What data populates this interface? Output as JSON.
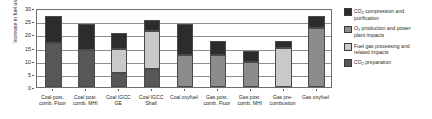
{
  "chart_data": {
    "type": "bar",
    "stacked": true,
    "title": "",
    "xlabel": "",
    "ylabel": "Increase in fuel use (%)",
    "ylim": [
      0,
      30
    ],
    "ytick_step": 5,
    "yticks": [
      "0",
      "5",
      "10",
      "15",
      "20",
      "25",
      "30"
    ],
    "grid": true,
    "legend_position": "right",
    "categories": [
      "Coal post.\ncomb. Fluor",
      "Coal post.\ncomb. MHI",
      "Coal IGCC\nGE",
      "Coal IGCC\nShall",
      "Coal oxyfuel",
      "Gas post.\ncomb. Fluor",
      "Gas post.\ncomb. MHI",
      "Gas pre-\ncombustion",
      "Gas oxyfuel"
    ],
    "series": [
      {
        "name": "CO2 preparation",
        "label_html": "CO<sub>2</sub> preparation",
        "color": "#575757",
        "values": [
          16.7,
          14.2,
          5.5,
          6.7,
          0,
          0,
          0,
          0,
          0
        ]
      },
      {
        "name": "Fuel gas processing and related impacts",
        "label_html": "Fuel gas processing and\nrelated impacts",
        "color": "#c9c9c9",
        "values": [
          0,
          0,
          9.0,
          14.6,
          0,
          0,
          0,
          14.8,
          0
        ]
      },
      {
        "name": "O2 production and power plant impacts",
        "label_html": "O<sub>2</sub> production and power\nplant impacts",
        "color": "#8c8c8c",
        "values": [
          0,
          0,
          0,
          0,
          12.0,
          12.0,
          9.5,
          0,
          22.5
        ]
      },
      {
        "name": "CO2 compression and purification",
        "label_html": "CO<sub>2</sub> compression and\npurification",
        "color": "#2c2c2c",
        "values": [
          10.1,
          9.8,
          6.2,
          4.2,
          12.0,
          5.5,
          4.3,
          2.7,
          4.5
        ]
      }
    ],
    "totals": [
      26.8,
      24.0,
      20.7,
      25.5,
      24.0,
      17.5,
      13.8,
      17.5,
      27.0
    ]
  },
  "legend": {
    "items": [
      {
        "label": "CO2 compression and purification",
        "line1": "CO",
        "sub1": "2",
        "rest1": " compression and",
        "line2": "purification",
        "color": "#2c2c2c"
      },
      {
        "label": "O2 production and power plant impacts",
        "line1": "O",
        "sub1": "2",
        "rest1": " production and power",
        "line2": "plant impacts",
        "color": "#8c8c8c"
      },
      {
        "label": "Fuel gas processing and related impacts",
        "line1": "Fuel gas processing and",
        "sub1": "",
        "rest1": "",
        "line2": "related impacts",
        "color": "#c9c9c9"
      },
      {
        "label": "CO2 preparation",
        "line1": "CO",
        "sub1": "2",
        "rest1": " preparation",
        "line2": "",
        "color": "#575757"
      }
    ]
  },
  "axis": {
    "y_title": "Increase in fuel use (%)"
  }
}
